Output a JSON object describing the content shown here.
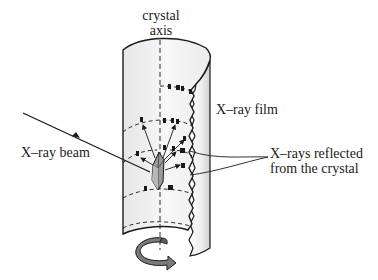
{
  "labels": {
    "crystal_axis_line1": "crystal",
    "crystal_axis_line2": "axis",
    "xray_film": "X–ray film",
    "xray_beam": "X–ray beam",
    "reflected_line1": "X–rays reflected",
    "reflected_line2": "from the crystal"
  },
  "colors": {
    "stroke": "#1a1a1a",
    "film_fill": "#f2f2f2",
    "film_edge_shade": "#d9d9d9",
    "crystal_fill": "#9a9a9a",
    "rotation_arrow": "#7a7a7a"
  },
  "icons": {
    "rotation": "rotation-arrow-icon",
    "crystal": "crystal-icon"
  }
}
